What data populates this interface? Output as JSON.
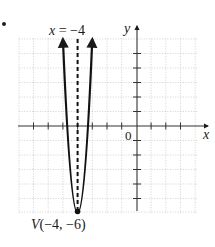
{
  "figure": {
    "axis_symmetry_label": "x = −4",
    "vertex_label": "V(−4, −6)",
    "x_axis_label": "x",
    "y_axis_label": "y",
    "origin_label": "0"
  },
  "chart_data": {
    "type": "line",
    "title": "",
    "xlabel": "x",
    "ylabel": "y",
    "xlim": [
      -8,
      4
    ],
    "ylim": [
      -6,
      6
    ],
    "grid": true,
    "grid_step": 1,
    "x_ticks": [
      -7,
      -6,
      -5,
      -4,
      -3,
      -2,
      -1,
      1,
      2,
      3
    ],
    "y_ticks": [
      -5,
      -4,
      -3,
      -2,
      -1,
      1,
      2,
      3,
      4,
      5
    ],
    "series": [
      {
        "name": "parabola",
        "equation": "y = 12(x + 4)^2 - 6",
        "style": "solid, with arrows at both ends",
        "x": [
          -5,
          -4.5,
          -4,
          -3.5,
          -3
        ],
        "y": [
          6,
          -3,
          -6,
          -3,
          6
        ]
      },
      {
        "name": "axis of symmetry",
        "equation": "x = -4",
        "style": "dashed",
        "x": [
          -4,
          -4
        ],
        "y": [
          -6,
          6
        ]
      }
    ],
    "annotations": [
      {
        "text": "x = −4",
        "x": -4,
        "y": 6.5
      },
      {
        "text": "V(−4, −6)",
        "x": -4,
        "y": -6,
        "marker": "filled-dot"
      },
      {
        "text": "0",
        "x": 0,
        "y": 0
      }
    ]
  }
}
